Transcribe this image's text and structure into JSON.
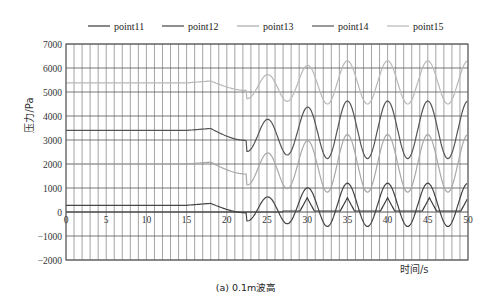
{
  "chart_data": {
    "type": "line",
    "title": "",
    "caption": "(a) 0.1m波高",
    "xlabel": "时间/s",
    "ylabel": "压力/Pa",
    "xlim": [
      0,
      50
    ],
    "ylim": [
      -2000,
      7000
    ],
    "xticks": [
      0,
      5,
      10,
      15,
      20,
      25,
      30,
      35,
      40,
      45,
      50
    ],
    "yticks": [
      -2000,
      -1000,
      0,
      1000,
      2000,
      3000,
      4000,
      5000,
      6000,
      7000
    ],
    "grid": {
      "vertical_step": 1,
      "horizontal_step": 1000
    },
    "legend_position": "top",
    "series": [
      {
        "name": "point11",
        "color": "#3a3a3a",
        "base": 0,
        "calm": 0,
        "amp": 0,
        "style": "impact"
      },
      {
        "name": "point12",
        "color": "#444444",
        "base": 280,
        "calm": 280,
        "amp": 900,
        "style": "wave"
      },
      {
        "name": "point13",
        "color": "#a8a8a8",
        "base": 2000,
        "calm": 2000,
        "amp": 1200,
        "style": "wave"
      },
      {
        "name": "point14",
        "color": "#555555",
        "base": 3400,
        "calm": 3400,
        "amp": 1200,
        "style": "wave"
      },
      {
        "name": "point15",
        "color": "#b8b8b8",
        "base": 5380,
        "calm": 5380,
        "amp": 900,
        "style": "wave"
      }
    ],
    "approx_points": {
      "point15": {
        "x": [
          0,
          18,
          20.5,
          22,
          25,
          27,
          30,
          32.5,
          35,
          37.5,
          40,
          42.5,
          45,
          47.5,
          50
        ],
        "y": [
          5380,
          5450,
          5250,
          5100,
          5700,
          4900,
          6000,
          4700,
          6100,
          4500,
          6100,
          4400,
          6100,
          4400,
          6100
        ]
      },
      "point14": {
        "x": [
          0,
          18,
          20.5,
          22,
          25,
          27,
          30,
          32.5,
          35,
          37.5,
          40,
          42.5,
          45,
          47.5,
          50
        ],
        "y": [
          3400,
          3500,
          3200,
          3100,
          3900,
          2800,
          4300,
          2100,
          4400,
          1900,
          4400,
          1900,
          4400,
          2000,
          4400
        ]
      },
      "point13": {
        "x": [
          0,
          18,
          20.5,
          22,
          25,
          27,
          30,
          32.5,
          35,
          37.5,
          40,
          42.5,
          45,
          47.5,
          50
        ],
        "y": [
          2000,
          2150,
          1850,
          1700,
          2500,
          1200,
          3100,
          200,
          3200,
          0,
          3200,
          200,
          3200,
          300,
          3200
        ]
      },
      "point12": {
        "x": [
          0,
          18,
          20.5,
          22,
          25,
          27,
          30,
          32.5,
          35,
          37.5,
          40,
          42.5,
          45,
          47.5,
          50
        ],
        "y": [
          280,
          350,
          50,
          -100,
          800,
          -600,
          1800,
          -100,
          1900,
          100,
          1900,
          200,
          1900,
          300,
          1900
        ]
      }
    }
  }
}
